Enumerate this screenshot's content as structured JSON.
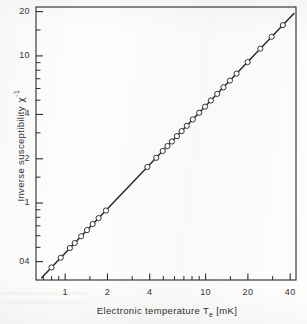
{
  "figure": {
    "background_color": "#fdfdfc",
    "ink_color": "#2b2b2b",
    "frame": {
      "left": 36,
      "top": 7,
      "right": 296,
      "bottom": 280
    }
  },
  "chart_data": {
    "type": "scatter",
    "title": "",
    "subtitle": "",
    "xlabel": "Electronic temperature T_e [mK]",
    "ylabel": "Inverse susceptibility χ⁻¹",
    "xscale": "log",
    "yscale": "log",
    "xlim": [
      0.62,
      44
    ],
    "ylim": [
      0.3,
      21.5
    ],
    "grid": false,
    "legend": null,
    "annotations": [],
    "xtick_labels": [
      "1",
      "2",
      "4",
      "10",
      "20",
      "40"
    ],
    "xtick_values": [
      1,
      2,
      4,
      10,
      20,
      40
    ],
    "xtick_minor_values": [
      0.7,
      0.8,
      0.9,
      1.5,
      3,
      5,
      6,
      7,
      8,
      9,
      15,
      30
    ],
    "ytick_labels": [
      "20",
      "10",
      "4",
      "2",
      "1",
      "04"
    ],
    "ytick_values": [
      20,
      10,
      4,
      2,
      1,
      0.4
    ],
    "ytick_minor_values": [
      15,
      9,
      8,
      7,
      6,
      5,
      3,
      1.5,
      0.9,
      0.8,
      0.7,
      0.6,
      0.5
    ],
    "series": [
      {
        "name": "data",
        "marker": "open-circle",
        "marker_size": 3.4,
        "line": "none",
        "x": [
          0.8,
          0.93,
          1.08,
          1.17,
          1.3,
          1.43,
          1.57,
          1.73,
          1.95,
          3.85,
          4.45,
          4.95,
          5.35,
          5.75,
          6.25,
          6.75,
          7.35,
          8.1,
          9.0,
          9.9,
          10.9,
          12.1,
          13.4,
          14.9,
          16.6,
          19.9,
          24.5,
          29.5,
          35.5
        ],
        "y": [
          0.365,
          0.425,
          0.495,
          0.535,
          0.595,
          0.655,
          0.72,
          0.79,
          0.89,
          1.76,
          2.03,
          2.26,
          2.44,
          2.62,
          2.85,
          3.08,
          3.35,
          3.7,
          4.11,
          4.52,
          4.98,
          5.52,
          6.12,
          6.8,
          7.58,
          9.08,
          11.2,
          13.5,
          16.2
        ]
      },
      {
        "name": "curie-law-fit",
        "marker": "none",
        "line": "solid",
        "line_width": 1.5,
        "x": [
          0.68,
          42.5
        ],
        "y": [
          0.311,
          19.4
        ]
      }
    ]
  },
  "axes": {
    "x_title_parts": {
      "pre": "Electronic temperature T",
      "sub": "e",
      "post": "[mK]"
    },
    "y_title_parts": {
      "pre": "Inverse susceptibility",
      "symbol": "χ",
      "sup": "-1"
    }
  }
}
